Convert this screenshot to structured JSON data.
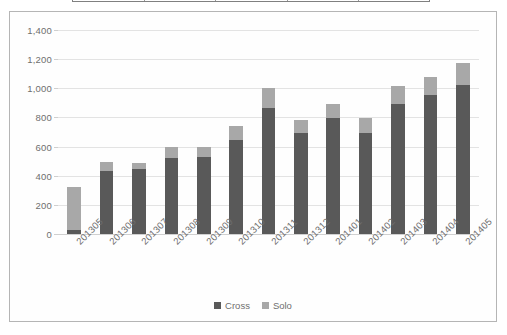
{
  "table_strip": {
    "visible": true,
    "column_dividers": 5,
    "border_color": "#808080"
  },
  "chart_data": {
    "type": "bar",
    "stacked": true,
    "title": "",
    "subtitle": "",
    "xlabel": "",
    "ylabel": "",
    "ylim": [
      0,
      1400
    ],
    "ytick_step": 200,
    "ytick_labels": [
      "0",
      "200",
      "400",
      "600",
      "800",
      "1,000",
      "1,200",
      "1,400"
    ],
    "ytick_values": [
      0,
      200,
      400,
      600,
      800,
      1000,
      1200,
      1400
    ],
    "grid": true,
    "legend_position": "bottom",
    "categories": [
      "201305",
      "201306",
      "201307",
      "201308",
      "201309",
      "201310",
      "201311",
      "201312",
      "201401",
      "201402",
      "201403",
      "201404",
      "201405"
    ],
    "series": [
      {
        "name": "Cross",
        "color": "#595959",
        "values": [
          25,
          430,
          445,
          520,
          530,
          645,
          865,
          690,
          795,
          695,
          890,
          955,
          1025
        ]
      },
      {
        "name": "Solo",
        "color": "#a8a8a8",
        "values": [
          295,
          65,
          45,
          80,
          65,
          95,
          135,
          95,
          95,
          100,
          125,
          120,
          150
        ]
      }
    ],
    "totals": [
      320,
      495,
      490,
      600,
      595,
      740,
      1000,
      785,
      890,
      795,
      1015,
      1075,
      1175
    ]
  },
  "legend": {
    "items": [
      {
        "label": "Cross",
        "color": "#595959"
      },
      {
        "label": "Solo",
        "color": "#a8a8a8"
      }
    ]
  },
  "colors": {
    "cross": "#595959",
    "solo": "#a8a8a8",
    "gridline": "#e3e3e3",
    "axis_text": "#6e6e6e",
    "frame": "#b5b5b5",
    "background": "#ffffff"
  }
}
